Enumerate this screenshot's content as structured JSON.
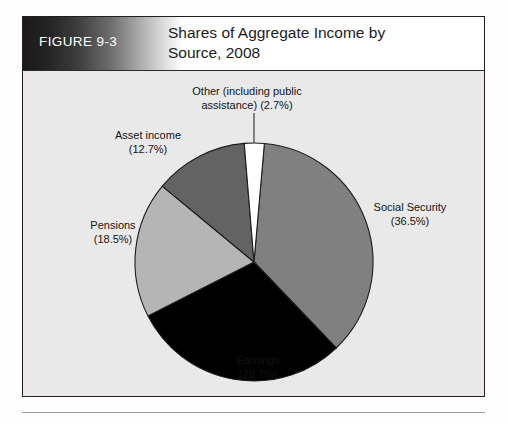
{
  "figure": {
    "number_label": "FIGURE 9-3",
    "title_line1": "Shares of Aggregate Income by",
    "title_line2": "Source, 2008"
  },
  "colors": {
    "panel_background": "#e9e9e9",
    "figure_border": "#231f20",
    "header_gradient_dark": "#1a1a1a",
    "header_gradient_light": "#ffffff",
    "slice_social_security": "#808080",
    "slice_earnings": "#000000",
    "slice_pensions": "#b5b5b5",
    "slice_asset_income": "#636363",
    "slice_other": "#ffffff",
    "slice_outline": "#1c1c1c",
    "label_text": "#141414",
    "bottom_rule": "#9b9b9b"
  },
  "labels": {
    "other_line1": "Other (including public",
    "other_line2": "assistance) (2.7%)",
    "asset_line1": "Asset income",
    "asset_line2": "(12.7%)",
    "pensions_line1": "Pensions",
    "pensions_line2": "(18.5%)",
    "social_line1": "Social Security",
    "social_line2": "(36.5%)",
    "earnings_line1": "Earnings",
    "earnings_line2": "(29.7%)"
  },
  "chart_data": {
    "type": "pie",
    "title": "Shares of Aggregate Income by Source, 2008",
    "subtitle": "",
    "xlabel": "",
    "ylabel": "",
    "legend_position": "none",
    "labels_inline": true,
    "start_angle_deg": 5,
    "direction": "clockwise",
    "categories": [
      "Social Security",
      "Earnings",
      "Pensions",
      "Asset income",
      "Other (including public assistance)"
    ],
    "values": [
      36.5,
      29.7,
      18.5,
      12.7,
      2.7
    ],
    "value_unit": "percent",
    "slices": [
      {
        "name": "Social Security",
        "value": 36.5,
        "display": "Social Security (36.5%)",
        "color": "#808080"
      },
      {
        "name": "Earnings",
        "value": 29.7,
        "display": "Earnings (29.7%)",
        "color": "#000000"
      },
      {
        "name": "Pensions",
        "value": 18.5,
        "display": "Pensions (18.5%)",
        "color": "#b5b5b5"
      },
      {
        "name": "Asset income",
        "value": 12.7,
        "display": "Asset income (12.7%)",
        "color": "#636363"
      },
      {
        "name": "Other (including public assistance)",
        "value": 2.7,
        "display": "Other (including public assistance) (2.7%)",
        "color": "#ffffff"
      }
    ]
  }
}
